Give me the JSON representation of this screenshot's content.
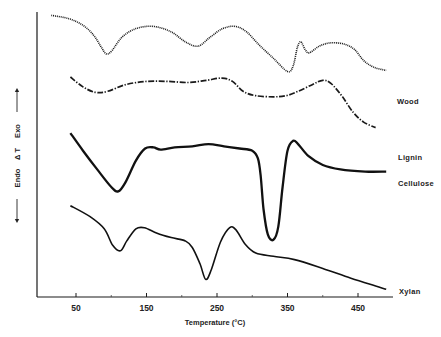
{
  "chart_data": {
    "type": "line",
    "title": "",
    "xlabel": "Temperature (°C)",
    "ylabel": "ΔT",
    "ylabel_up": "Exo",
    "ylabel_down": "Endo",
    "xlim": [
      -8,
      495
    ],
    "xticks": [
      50,
      150,
      250,
      350,
      450
    ],
    "grid": false,
    "legend_position": "inline-right",
    "y_units": "relative (arbitrary, curves vertically offset)",
    "series": [
      {
        "name": "Wood",
        "style": "dotted",
        "points": [
          [
            15,
            6
          ],
          [
            40,
            3
          ],
          [
            60,
            -3
          ],
          [
            75,
            -12
          ],
          [
            85,
            -22
          ],
          [
            93,
            -29
          ],
          [
            101,
            -26
          ],
          [
            115,
            -14
          ],
          [
            135,
            -6
          ],
          [
            160,
            -4
          ],
          [
            185,
            -9
          ],
          [
            205,
            -18
          ],
          [
            223,
            -22
          ],
          [
            240,
            -14
          ],
          [
            258,
            -6
          ],
          [
            276,
            -4
          ],
          [
            292,
            -9
          ],
          [
            310,
            -21
          ],
          [
            330,
            -33
          ],
          [
            350,
            -45
          ],
          [
            358,
            -40
          ],
          [
            364,
            -23
          ],
          [
            369,
            -18
          ],
          [
            375,
            -25
          ],
          [
            381,
            -28
          ],
          [
            395,
            -22
          ],
          [
            410,
            -19
          ],
          [
            430,
            -20
          ],
          [
            445,
            -25
          ],
          [
            458,
            -35
          ],
          [
            472,
            -41
          ],
          [
            490,
            -44
          ]
        ]
      },
      {
        "name": "Lignin",
        "style": "dash-dot",
        "points": [
          [
            42,
            -50
          ],
          [
            60,
            -59
          ],
          [
            78,
            -64
          ],
          [
            95,
            -63
          ],
          [
            120,
            -57
          ],
          [
            150,
            -54
          ],
          [
            180,
            -54
          ],
          [
            210,
            -55
          ],
          [
            235,
            -53
          ],
          [
            257,
            -51
          ],
          [
            272,
            -54
          ],
          [
            287,
            -63
          ],
          [
            305,
            -67
          ],
          [
            330,
            -68
          ],
          [
            348,
            -67
          ],
          [
            365,
            -63
          ],
          [
            385,
            -57
          ],
          [
            400,
            -53
          ],
          [
            412,
            -56
          ],
          [
            428,
            -68
          ],
          [
            443,
            -82
          ],
          [
            458,
            -91
          ],
          [
            475,
            -96
          ]
        ]
      },
      {
        "name": "Cellulose",
        "style": "solid-thick",
        "points": [
          [
            42,
            -101
          ],
          [
            60,
            -117
          ],
          [
            80,
            -134
          ],
          [
            100,
            -150
          ],
          [
            110,
            -154
          ],
          [
            120,
            -146
          ],
          [
            135,
            -126
          ],
          [
            148,
            -115
          ],
          [
            160,
            -114
          ],
          [
            170,
            -116
          ],
          [
            190,
            -114
          ],
          [
            215,
            -113
          ],
          [
            238,
            -111
          ],
          [
            260,
            -113
          ],
          [
            282,
            -115
          ],
          [
            300,
            -117
          ],
          [
            308,
            -124
          ],
          [
            312,
            -140
          ],
          [
            316,
            -170
          ],
          [
            322,
            -193
          ],
          [
            330,
            -198
          ],
          [
            337,
            -186
          ],
          [
            343,
            -150
          ],
          [
            350,
            -117
          ],
          [
            358,
            -108
          ],
          [
            365,
            -111
          ],
          [
            380,
            -122
          ],
          [
            400,
            -130
          ],
          [
            425,
            -134
          ],
          [
            460,
            -136
          ],
          [
            490,
            -136
          ]
        ]
      },
      {
        "name": "Xylan",
        "style": "solid",
        "points": [
          [
            42,
            -167
          ],
          [
            70,
            -177
          ],
          [
            90,
            -188
          ],
          [
            102,
            -203
          ],
          [
            113,
            -208
          ],
          [
            122,
            -199
          ],
          [
            135,
            -188
          ],
          [
            147,
            -187
          ],
          [
            165,
            -192
          ],
          [
            185,
            -196
          ],
          [
            205,
            -199
          ],
          [
            215,
            -205
          ],
          [
            226,
            -220
          ],
          [
            234,
            -234
          ],
          [
            242,
            -225
          ],
          [
            255,
            -200
          ],
          [
            268,
            -187
          ],
          [
            277,
            -189
          ],
          [
            290,
            -202
          ],
          [
            305,
            -210
          ],
          [
            330,
            -213
          ],
          [
            360,
            -216
          ],
          [
            400,
            -224
          ],
          [
            440,
            -233
          ],
          [
            475,
            -240
          ],
          [
            490,
            -243
          ]
        ]
      }
    ]
  },
  "axes": {
    "x_tick_labels": [
      "50",
      "150",
      "250",
      "350",
      "450"
    ],
    "x_title": "Temperature (°C)",
    "y_exo": "Exo",
    "y_delta": "Δ T",
    "y_endo": "Endo"
  },
  "labels": {
    "wood": "Wood",
    "lignin": "Lignin",
    "cellulose": "Cellulose",
    "xylan": "Xylan"
  }
}
